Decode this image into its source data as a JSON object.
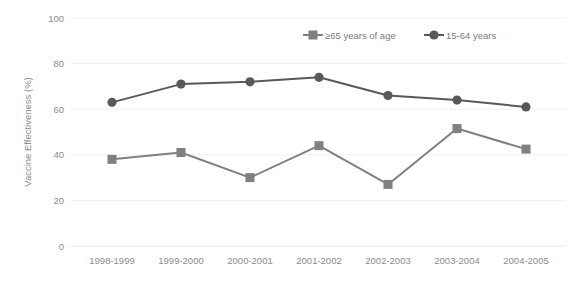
{
  "chart_data": {
    "type": "line",
    "title": "",
    "xlabel": "",
    "ylabel": "Vaccine Effectiveness (%)",
    "ylim": [
      0,
      100
    ],
    "yticks": [
      0,
      20,
      40,
      60,
      80,
      100
    ],
    "grid": "horizontal",
    "legend_position": "top-center",
    "categories": [
      "1998-1999",
      "1999-2000",
      "2000-2001",
      "2001-2002",
      "2002-2003",
      "2003-2004",
      "2004-2005"
    ],
    "series": [
      {
        "name": "≥65 years of age",
        "marker": "square",
        "color": "#808080",
        "values": [
          38,
          41,
          30,
          44,
          27,
          51.5,
          42.5
        ]
      },
      {
        "name": "15-64 years",
        "marker": "circle",
        "color": "#595959",
        "values": [
          63,
          71,
          72,
          74,
          66,
          64,
          61
        ]
      }
    ]
  },
  "axis": {
    "y_title": "Vaccine Effectiveness (%)",
    "y_tick_labels": [
      "100",
      "80",
      "60",
      "40",
      "20",
      "0"
    ],
    "x_tick_labels": [
      "1998-1999",
      "1999-2000",
      "2000-2001",
      "2001-2002",
      "2002-2003",
      "2003-2004",
      "2004-2005"
    ]
  },
  "legend": {
    "entries": [
      {
        "label": "≥65 years of age",
        "color": "#808080",
        "marker": "square"
      },
      {
        "label": "15-64 years",
        "color": "#595959",
        "marker": "circle"
      }
    ]
  },
  "colors": {
    "background": "#ffffff",
    "gridline": "#f0f0f0",
    "text": "#8c8c8c",
    "series_65plus": "#808080",
    "series_15_64": "#595959"
  }
}
